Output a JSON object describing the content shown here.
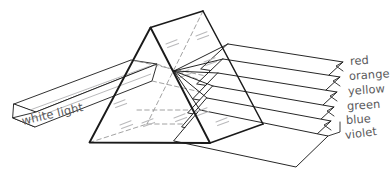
{
  "figure": {
    "type": "optics-diagram",
    "background_color": "#ffffff",
    "line_color": "#1a1a1a",
    "hidden_line_color": "#8a8a8a",
    "sparkle_color": "#b9b9bb",
    "text_color": "#59595b"
  },
  "incident_beam": {
    "label": "white light",
    "label_rotation_deg": -13,
    "label_x": 22,
    "label_y": 123
  },
  "spectrum": {
    "label_rotation_deg": -4,
    "bands": [
      {
        "name": "red",
        "label": "red",
        "color": "#e02b20",
        "x": 350,
        "y": 62
      },
      {
        "name": "orange",
        "label": "orange",
        "color": "#f07f17",
        "x": 349,
        "y": 77
      },
      {
        "name": "yellow",
        "label": "yellow",
        "color": "#f2d41a",
        "x": 348,
        "y": 92
      },
      {
        "name": "green",
        "label": "green",
        "color": "#2faa44",
        "x": 347,
        "y": 107
      },
      {
        "name": "blue",
        "label": "blue",
        "color": "#2a58c0",
        "x": 346,
        "y": 121
      },
      {
        "name": "violet",
        "label": "violet",
        "color": "#7a35a8",
        "x": 345,
        "y": 136
      }
    ]
  },
  "prism": {
    "name": "triangular-prism",
    "front_triangle": [
      [
        150.5,
        27.5
      ],
      [
        89.5,
        142.5
      ],
      [
        210.0,
        143.0
      ]
    ],
    "back_triangle": [
      [
        203.0,
        11.0
      ],
      [
        147.0,
        124.0
      ],
      [
        263.0,
        124.0
      ]
    ]
  }
}
